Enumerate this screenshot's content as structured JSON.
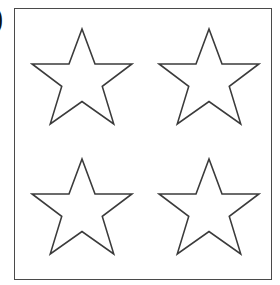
{
  "page": {
    "background_color": "#ffffff",
    "width": 280,
    "height": 285
  },
  "item_marker": {
    "text": ")",
    "note_color": "#111111"
  },
  "answer_box": {
    "border_color": "#4a4a4a",
    "fill_color": "#ffffff",
    "left": 14,
    "top": 8,
    "width": 258,
    "height": 272
  },
  "shapes": {
    "kind": "star",
    "points": 5,
    "count": 4,
    "outline_color": "#3b3b3b",
    "fill_color": "#ffffff",
    "rows": 2,
    "columns": 2,
    "items": [
      {
        "id": "star-top-left",
        "label": "star",
        "row": 1,
        "column": 1
      },
      {
        "id": "star-top-right",
        "label": "star",
        "row": 1,
        "column": 2
      },
      {
        "id": "star-bottom-left",
        "label": "star",
        "row": 2,
        "column": 1
      },
      {
        "id": "star-bottom-right",
        "label": "star",
        "row": 2,
        "column": 2
      }
    ]
  }
}
